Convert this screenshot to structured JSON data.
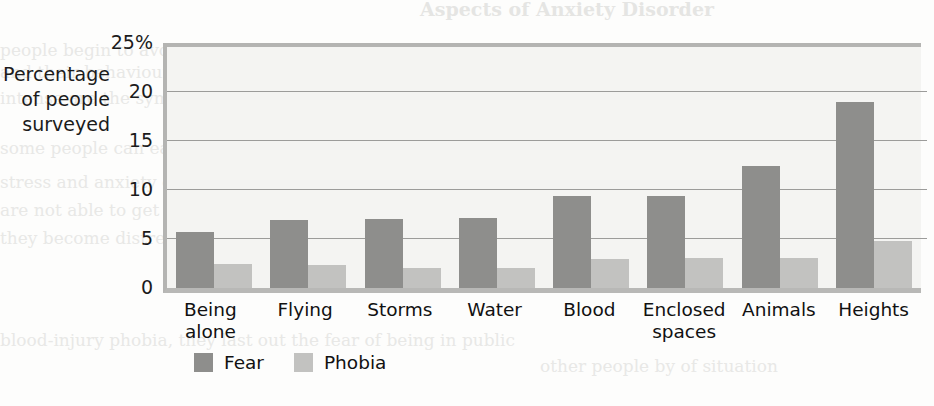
{
  "page": {
    "background_color": "#fdfdfc",
    "ghost_text": [
      {
        "text": "Aspects of Anxiety Disorder",
        "x": 420,
        "y": -2,
        "size": 19,
        "head": true
      },
      {
        "text": "people begin to avoid all the places or situations they",
        "x": 0,
        "y": 40,
        "size": 17,
        "faint": false
      },
      {
        "text": "and their behaviours. In the end of a panic attack, it is out of control",
        "x": 0,
        "y": 62,
        "size": 17,
        "faint": false
      },
      {
        "text": "intense are the symptoms, that nearly also go on – the fear that the",
        "x": 0,
        "y": 88,
        "size": 17,
        "faint": false
      },
      {
        "text": "some people can easily find any physical problem",
        "x": 0,
        "y": 138,
        "size": 17,
        "faint": false
      },
      {
        "text": "stress and anxiety of the sufferer. Agoraphobia: Activities and",
        "x": 0,
        "y": 172,
        "size": 17,
        "faint": false
      },
      {
        "text": "are not able to get help, being unable to escape the attack, so",
        "x": 0,
        "y": 200,
        "size": 17,
        "faint": false
      },
      {
        "text": "they become distressing. Each attack, escape, and",
        "x": 0,
        "y": 228,
        "size": 17,
        "faint": false
      },
      {
        "text": "blood-injury phobia, they last out the fear of being in public",
        "x": 0,
        "y": 330,
        "size": 17,
        "faint": false
      },
      {
        "text": "other people by of situation",
        "x": 540,
        "y": 356,
        "size": 17,
        "faint": false
      }
    ]
  },
  "chart_data": {
    "type": "bar",
    "title": "",
    "subtitle": "",
    "xlabel": "",
    "ylabel": "Percentage of people surveyed",
    "ylabel_lines": [
      "Percentage",
      "of people",
      "surveyed"
    ],
    "ylim": [
      0,
      25
    ],
    "ytick_values": [
      0,
      5,
      10,
      15,
      20,
      25
    ],
    "ytick_labels": [
      "0",
      "5",
      "10",
      "15",
      "20",
      "25%"
    ],
    "grid": true,
    "grid_axis": "y",
    "legend_position": "bottom-left",
    "categories": [
      "Being alone",
      "Flying",
      "Storms",
      "Water",
      "Blood",
      "Enclosed spaces",
      "Animals",
      "Heights"
    ],
    "category_label_lines": [
      [
        "Being",
        "alone"
      ],
      [
        "Flying"
      ],
      [
        "Storms"
      ],
      [
        "Water"
      ],
      [
        "Blood"
      ],
      [
        "Enclosed",
        "spaces"
      ],
      [
        "Animals"
      ],
      [
        "Heights"
      ]
    ],
    "series": [
      {
        "name": "Fear",
        "color": "#8e8e8c",
        "values": [
          5.7,
          6.9,
          7.0,
          7.1,
          9.4,
          9.4,
          12.4,
          19.0
        ]
      },
      {
        "name": "Phobia",
        "color": "#c2c2c0",
        "values": [
          2.5,
          2.3,
          2.0,
          2.0,
          3.0,
          3.1,
          3.1,
          4.8
        ]
      }
    ]
  },
  "legend": {
    "items": [
      {
        "label": "Fear",
        "color": "#8e8e8c"
      },
      {
        "label": "Phobia",
        "color": "#c2c2c0"
      }
    ]
  },
  "colors": {
    "fear": "#8e8e8c",
    "phobia": "#c2c2c0",
    "plot_background": "#f4f4f2",
    "gridline": "#9c9c9a",
    "axis": "#b4b4b2",
    "text": "#111111"
  }
}
